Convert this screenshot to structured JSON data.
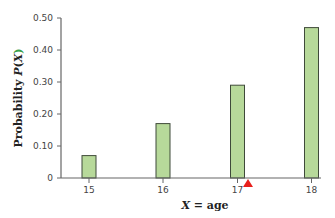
{
  "chart_data": {
    "type": "bar",
    "title": "",
    "xlabel": "X = age",
    "ylabel": "Probability P(X)",
    "categories": [
      "15",
      "16",
      "17",
      "18"
    ],
    "values": [
      0.07,
      0.17,
      0.29,
      0.47
    ],
    "ylim": [
      0,
      0.5
    ],
    "yticks": [
      0,
      0.1,
      0.2,
      0.3,
      0.4,
      0.5
    ],
    "ytick_labels": [
      "0",
      "0.10",
      "0.20",
      "0.30",
      "0.40",
      "0.50"
    ],
    "grid": false,
    "legend": null,
    "annotations": [
      {
        "type": "marker",
        "shape": "triangle-up",
        "color": "#e8201c",
        "x": 17.23,
        "y": 0,
        "description": "mean marker on x-axis"
      }
    ]
  },
  "colors": {
    "bar_fill": "#b7d99a",
    "bar_stroke": "#3f4a3a",
    "axis": "#666666",
    "marker": "#e8201c",
    "label_accent": "#3aa04a"
  },
  "labels": {
    "xlabel_var": "X",
    "xlabel_rest": " = age",
    "ylabel_word": "Probability ",
    "ylabel_var": "P",
    "ylabel_open": "(",
    "ylabel_x": "X",
    "ylabel_close": ")"
  }
}
